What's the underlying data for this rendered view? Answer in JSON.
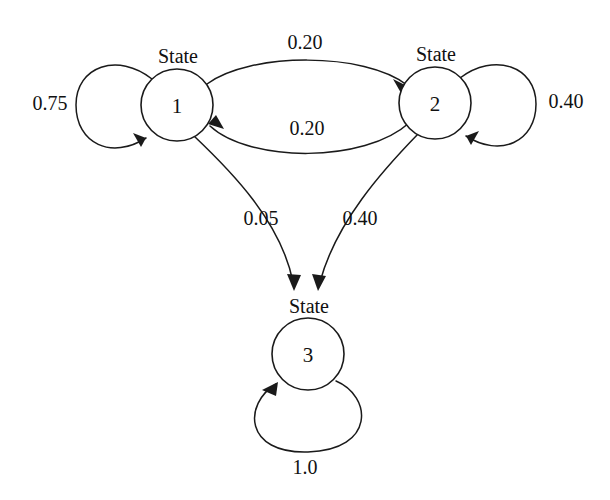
{
  "diagram": {
    "background_color": "#ffffff",
    "stroke_color": "#1a1a1a",
    "nodes": [
      {
        "caption": "State",
        "id": "1",
        "cx": 177,
        "cy": 105,
        "r": 36
      },
      {
        "caption": "State",
        "id": "2",
        "cx": 435,
        "cy": 103,
        "r": 36
      },
      {
        "caption": "State",
        "id": "3",
        "cx": 308,
        "cy": 354,
        "r": 36
      }
    ],
    "transitions": [
      {
        "from": "1",
        "to": "1",
        "probability": "0.75",
        "label_x": 50,
        "label_y": 103,
        "kind": "self-loop-left"
      },
      {
        "from": "1",
        "to": "2",
        "probability": "0.20",
        "label_x": 305,
        "label_y": 42,
        "kind": "arc-top"
      },
      {
        "from": "2",
        "to": "1",
        "probability": "0.20",
        "label_x": 307,
        "label_y": 128,
        "kind": "arc-bottom"
      },
      {
        "from": "2",
        "to": "2",
        "probability": "0.40",
        "label_x": 566,
        "label_y": 101,
        "kind": "self-loop-right"
      },
      {
        "from": "1",
        "to": "3",
        "probability": "0.05",
        "label_x": 261,
        "label_y": 218,
        "kind": "curve-down-left"
      },
      {
        "from": "2",
        "to": "3",
        "probability": "0.40",
        "label_x": 360,
        "label_y": 218,
        "kind": "curve-down-right"
      },
      {
        "from": "3",
        "to": "3",
        "probability": "1.0",
        "label_x": 305,
        "label_y": 467,
        "kind": "self-loop-bottom"
      }
    ]
  }
}
